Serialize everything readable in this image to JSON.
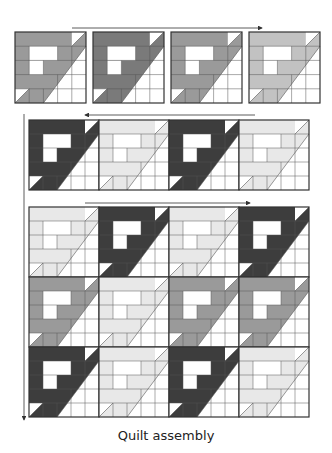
{
  "caption": "Quilt assembly",
  "colors": {
    "dark": "#3d3d3d",
    "darkish": "#7a7a7a",
    "medium": "#9a9a9a",
    "light": "#c2c2c2",
    "pale": "#e8e8e8",
    "white": "#ffffff",
    "line": "#333333"
  },
  "rows": [
    {
      "name": "row-1",
      "x": 15,
      "y": 32,
      "size": 71,
      "gap": 7,
      "shades": [
        "medium",
        "darkish",
        "medium",
        "light"
      ],
      "arrow": {
        "x1": 72,
        "y1": 28,
        "x2": 262,
        "y2": 28,
        "direction": "right"
      }
    },
    {
      "name": "row-2",
      "x": 29,
      "y": 120,
      "size": 70,
      "gap": 0,
      "shades": [
        "dark",
        "pale",
        "dark",
        "pale"
      ],
      "arrow": {
        "x1": 255,
        "y1": 115,
        "x2": 85,
        "y2": 115,
        "direction": "left"
      }
    },
    {
      "name": "row-3",
      "x": 29,
      "y": 207,
      "size": 70,
      "gap": 0,
      "shades": [
        "pale",
        "dark",
        "pale",
        "dark"
      ],
      "arrow": {
        "x1": 85,
        "y1": 203,
        "x2": 250,
        "y2": 203,
        "direction": "right"
      }
    },
    {
      "name": "row-4",
      "x": 29,
      "y": 277,
      "size": 70,
      "gap": 0,
      "shades": [
        "medium",
        "pale",
        "medium",
        "medium"
      ],
      "arrow": null
    },
    {
      "name": "row-5",
      "x": 29,
      "y": 347,
      "size": 70,
      "gap": 0,
      "shades": [
        "dark",
        "pale",
        "dark",
        "pale"
      ],
      "arrow": null
    }
  ],
  "vertical_arrow": {
    "x": 24,
    "y1": 114,
    "y2": 420
  }
}
